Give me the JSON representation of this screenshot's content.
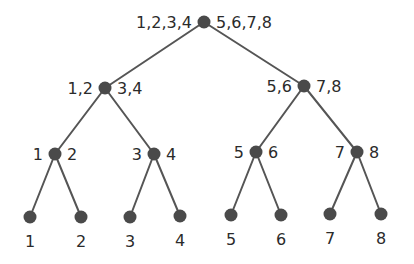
{
  "diagram": {
    "type": "binary-tree",
    "colors": {
      "background": "#ffffff",
      "node": "#4a4a4a",
      "edge": "#555555",
      "text": "#2b2b2b"
    },
    "nodes": [
      {
        "id": "root",
        "x": 204,
        "y": 22,
        "left_label": "1,2,3,4",
        "right_label": "5,6,7,8"
      },
      {
        "id": "n12_34",
        "x": 105,
        "y": 88,
        "left_label": "1,2",
        "right_label": "3,4"
      },
      {
        "id": "n56_78",
        "x": 304,
        "y": 86,
        "left_label": "5,6",
        "right_label": "7,8"
      },
      {
        "id": "n1_2",
        "x": 55,
        "y": 154,
        "left_label": "1",
        "right_label": "2"
      },
      {
        "id": "n3_4",
        "x": 154,
        "y": 154,
        "left_label": "3",
        "right_label": "4"
      },
      {
        "id": "n5_6",
        "x": 256,
        "y": 152,
        "left_label": "5",
        "right_label": "6"
      },
      {
        "id": "n7_8",
        "x": 357,
        "y": 152,
        "left_label": "7",
        "right_label": "8"
      },
      {
        "id": "leaf1",
        "x": 30,
        "y": 217,
        "bottom_label": "1"
      },
      {
        "id": "leaf2",
        "x": 81,
        "y": 217,
        "bottom_label": "2"
      },
      {
        "id": "leaf3",
        "x": 130,
        "y": 217,
        "bottom_label": "3"
      },
      {
        "id": "leaf4",
        "x": 180,
        "y": 216,
        "bottom_label": "4"
      },
      {
        "id": "leaf5",
        "x": 231,
        "y": 215,
        "bottom_label": "5"
      },
      {
        "id": "leaf6",
        "x": 281,
        "y": 215,
        "bottom_label": "6"
      },
      {
        "id": "leaf7",
        "x": 330,
        "y": 214,
        "bottom_label": "7"
      },
      {
        "id": "leaf8",
        "x": 381,
        "y": 214,
        "bottom_label": "8"
      }
    ],
    "edges": [
      [
        "root",
        "n12_34"
      ],
      [
        "root",
        "n56_78"
      ],
      [
        "n12_34",
        "n1_2"
      ],
      [
        "n12_34",
        "n3_4"
      ],
      [
        "n56_78",
        "n5_6"
      ],
      [
        "n56_78",
        "n7_8"
      ],
      [
        "n1_2",
        "leaf1"
      ],
      [
        "n1_2",
        "leaf2"
      ],
      [
        "n3_4",
        "leaf3"
      ],
      [
        "n3_4",
        "leaf4"
      ],
      [
        "n5_6",
        "leaf5"
      ],
      [
        "n5_6",
        "leaf6"
      ],
      [
        "n7_8",
        "leaf7"
      ],
      [
        "n7_8",
        "leaf8"
      ]
    ],
    "node_radius": 6.5,
    "label_gap": 12
  }
}
